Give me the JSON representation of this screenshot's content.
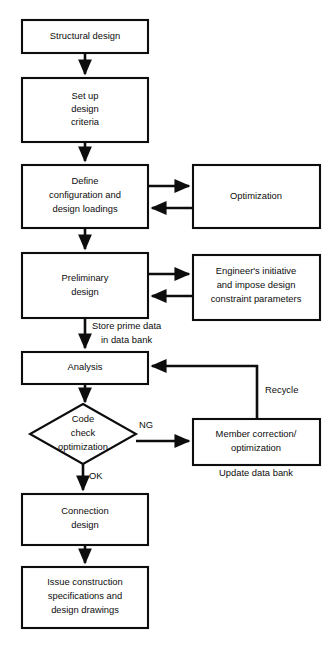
{
  "diagram": {
    "stroke_color": "#0d0d0d",
    "fill_color": "#ffffff",
    "nodes": [
      {
        "id": "structural-design",
        "shape": "rect",
        "lines": [
          "Structural design"
        ]
      },
      {
        "id": "set-up-design-criteria",
        "shape": "rect",
        "lines": [
          "Set up",
          "design",
          "criteria"
        ]
      },
      {
        "id": "define-configuration",
        "shape": "rect",
        "lines": [
          "Define",
          "configuration and",
          "design loadings"
        ]
      },
      {
        "id": "optimization",
        "shape": "rect",
        "lines": [
          "Optimization"
        ]
      },
      {
        "id": "preliminary-design",
        "shape": "rect",
        "lines": [
          "Preliminary",
          "design"
        ]
      },
      {
        "id": "engineers-initiative",
        "shape": "rect",
        "lines": [
          "Engineer's initiative",
          "and impose design",
          "constraint parameters"
        ]
      },
      {
        "id": "analysis",
        "shape": "rect",
        "lines": [
          "Analysis"
        ]
      },
      {
        "id": "code-check-optimization",
        "shape": "diamond",
        "lines": [
          "Code",
          "check",
          "optimization"
        ]
      },
      {
        "id": "member-correction",
        "shape": "rect",
        "lines": [
          "Member correction/",
          "optimization"
        ]
      },
      {
        "id": "connection-design",
        "shape": "rect",
        "lines": [
          "Connection",
          "design"
        ]
      },
      {
        "id": "issue-construction",
        "shape": "rect",
        "lines": [
          "Issue construction",
          "specifications and",
          "design drawings"
        ]
      }
    ],
    "edge_labels": {
      "store_prime_data": [
        "Store prime data",
        "in data bank"
      ],
      "ng": "NG",
      "ok": "OK",
      "recycle": "Recycle",
      "update_data_bank": "Update data bank"
    }
  }
}
